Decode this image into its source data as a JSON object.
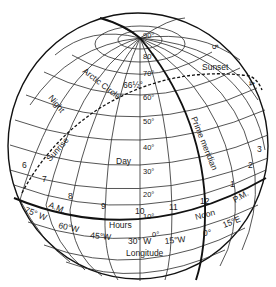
{
  "diagram": {
    "latitude_labels": [
      "90°",
      "80°",
      "70°",
      "60°",
      "50°",
      "40°",
      "30°",
      "20°",
      "10°",
      "0°"
    ],
    "arctic_circle_label": "Arctic Circle",
    "arctic_circle_value": "66½°",
    "region_labels": {
      "night": "Night",
      "day": "Day",
      "sunrise": "Sunrise",
      "sunset": "Sunset"
    },
    "prime_meridian_label": "Prime meridian",
    "hours_label": "Hours",
    "longitude_label": "Longitude",
    "am_label": "A.M.",
    "pm_label": "P.M.",
    "noon_label": "Noon",
    "hour_numbers": [
      "6",
      "7",
      "8",
      "9",
      "10",
      "11",
      "12",
      "1",
      "2",
      "3",
      "4",
      "5"
    ],
    "longitude_values": [
      "75° W",
      "60°W",
      "45°W",
      "30° W",
      "15°W",
      "0°",
      "15°E"
    ],
    "colors": {
      "line": "#111111",
      "background": "#ffffff"
    }
  }
}
